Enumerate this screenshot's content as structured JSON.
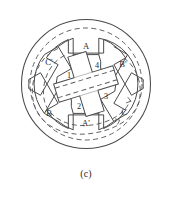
{
  "figure": {
    "caption": "(c)",
    "title": "",
    "type": "switched-reluctance-motor-cross-section",
    "colors": {
      "line": "#4a4a4a",
      "dashed": "#5a5a5a",
      "text": "#2a2a2a",
      "background": "#ffffff"
    },
    "geometry": {
      "center_x": 86,
      "center_y": 84,
      "outer_housing_radius": 65,
      "dashed_yoke_radius": 56,
      "stator_bore_radius": 47,
      "rotor_hub_radius": 13,
      "rotor_pole_tip_radius": 34,
      "rotor_rotation_deg": -17
    }
  },
  "stator": {
    "pole_count": 6,
    "poles": [
      {
        "label": "A",
        "angle_deg": 270,
        "label_x": 86,
        "label_y": 34
      },
      {
        "label": "B'",
        "angle_deg": 330,
        "label_x": 124,
        "label_y": 56
      },
      {
        "label": "C",
        "angle_deg": 30,
        "label_x": 126,
        "label_y": 110
      },
      {
        "label": "A'",
        "angle_deg": 90,
        "label_x": 86,
        "label_y": 134
      },
      {
        "label": "B",
        "angle_deg": 150,
        "label_x": 46,
        "label_y": 112
      },
      {
        "label": "C'",
        "angle_deg": 210,
        "label_x": 48,
        "label_y": 56
      }
    ]
  },
  "rotor": {
    "pole_count": 4,
    "poles": [
      {
        "label": "1",
        "label_x": 70,
        "label_y": 76
      },
      {
        "label": "2",
        "label_x": 79,
        "label_y": 106
      },
      {
        "label": "3",
        "label_x": 106,
        "label_y": 97
      },
      {
        "label": "4",
        "label_x": 97,
        "label_y": 66
      }
    ]
  },
  "flux": {
    "description": "dashed magnetic flux path",
    "arrow_count": 2,
    "paths": [
      "inner-yoke-loop",
      "rotor-axis-through-poles-1-3"
    ]
  }
}
